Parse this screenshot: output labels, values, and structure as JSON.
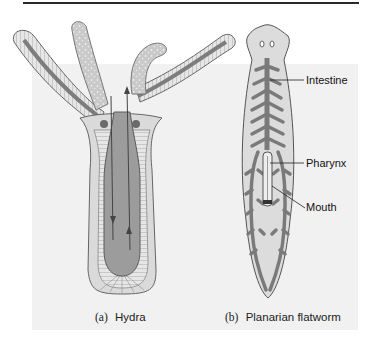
{
  "figure": {
    "panels": [
      {
        "id": "a",
        "letter": "(a)",
        "title": "Hydra"
      },
      {
        "id": "b",
        "letter": "(b)",
        "title": "Planarian flatworm"
      }
    ],
    "labels": {
      "intestine": "Intestine",
      "pharynx": "Pharynx",
      "mouth": "Mouth"
    },
    "colors": {
      "background_panel": "#f1f1f1",
      "gut": "#8a8a8a",
      "outline": "#555555",
      "tissue": "#d8d8d8"
    }
  }
}
